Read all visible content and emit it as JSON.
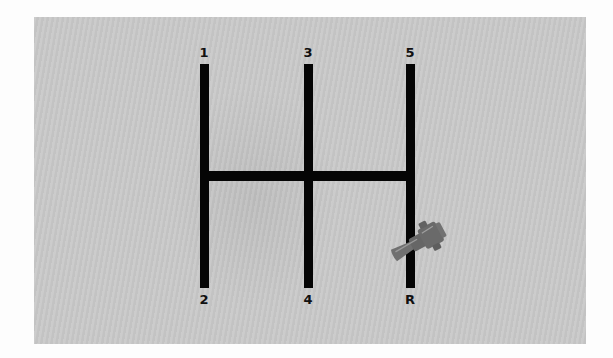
{
  "gate": {
    "top_labels": [
      "1",
      "3",
      "5"
    ],
    "bottom_labels": [
      "2",
      "4",
      "R"
    ]
  },
  "knob": {
    "icon": "gear-shift-knob-icon",
    "current_slot": "between-neutral-and-R"
  },
  "colors": {
    "panel": "#c9c9c9",
    "bars": "#050505",
    "knob": "#6e6e6e",
    "background": "#fdfdfd"
  }
}
